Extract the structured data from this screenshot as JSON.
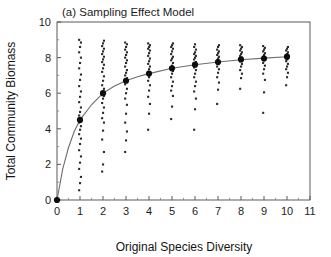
{
  "figure": {
    "panel_label": "(a)",
    "title": "Sampling Effect Model",
    "title_full": "(a)  Sampling Effect Model",
    "background_color": "#ffffff",
    "axis_color": "#5a5a5a",
    "point_color": "#2b2b2b",
    "curve_color": "#6e6e6e"
  },
  "chart_data": {
    "type": "scatter",
    "title": "(a)  Sampling Effect Model",
    "xlabel": "Original Species Diversity",
    "ylabel": "Total Community Biomass",
    "xlim": [
      0,
      11
    ],
    "ylim": [
      0,
      10
    ],
    "xticks": [
      0,
      1,
      2,
      3,
      4,
      5,
      6,
      7,
      8,
      9,
      10,
      11
    ],
    "yticks": [
      0,
      2,
      4,
      6,
      8,
      10
    ],
    "xtick_labels": [
      "0",
      "1",
      "2",
      "3",
      "4",
      "5",
      "6",
      "7",
      "8",
      "9",
      "10",
      "11"
    ],
    "ytick_labels": [
      "0",
      "2",
      "4",
      "6",
      "8",
      "10"
    ],
    "x_minor_tick_interval": 1,
    "y_minor_tick_interval": 1,
    "grid": false,
    "legend": false,
    "legend_position": "none",
    "series": [
      {
        "name": "Mean total community biomass",
        "marker": "filled-circle",
        "x": [
          0,
          1,
          2,
          3,
          4,
          5,
          6,
          7,
          8,
          9,
          10
        ],
        "values": [
          0.0,
          4.5,
          6.0,
          6.7,
          7.1,
          7.4,
          7.6,
          7.75,
          7.9,
          7.95,
          8.05
        ]
      },
      {
        "name": "Fitted saturating curve",
        "marker": "line",
        "x": [
          0,
          0.25,
          0.5,
          0.75,
          1,
          1.5,
          2,
          2.5,
          3,
          3.5,
          4,
          5,
          6,
          7,
          8,
          9,
          10
        ],
        "values": [
          0.0,
          1.75,
          2.95,
          3.85,
          4.5,
          5.35,
          6.0,
          6.4,
          6.7,
          6.92,
          7.1,
          7.4,
          7.6,
          7.75,
          7.88,
          7.97,
          8.05
        ]
      }
    ],
    "scatter_columns": [
      {
        "x": 0,
        "values": [
          0.0
        ]
      },
      {
        "x": 1,
        "values": [
          0.55,
          0.95,
          1.3,
          1.75,
          2.1,
          2.45,
          2.8,
          3.15,
          3.45,
          3.7,
          3.95,
          4.15,
          4.35,
          4.5,
          4.6,
          4.75,
          4.95,
          5.2,
          5.5,
          5.8,
          6.1,
          6.4,
          6.75,
          7.05,
          7.4,
          7.7,
          8.0,
          8.3,
          8.6,
          8.85,
          9.0
        ]
      },
      {
        "x": 2,
        "values": [
          1.6,
          2.0,
          2.7,
          3.4,
          3.9,
          4.35,
          4.6,
          4.9,
          5.2,
          5.45,
          5.7,
          5.85,
          6.0,
          6.1,
          6.25,
          6.45,
          6.7,
          6.95,
          7.2,
          7.4,
          7.6,
          7.75,
          7.9,
          8.05,
          8.2,
          8.35,
          8.5,
          8.65,
          8.8,
          8.95
        ]
      },
      {
        "x": 3,
        "values": [
          2.7,
          3.35,
          3.85,
          4.35,
          4.85,
          5.35,
          5.7,
          6.0,
          6.25,
          6.5,
          6.7,
          6.85,
          7.0,
          7.15,
          7.3,
          7.5,
          7.7,
          7.85,
          8.0,
          8.15,
          8.3,
          8.45,
          8.6,
          8.75,
          8.85
        ]
      },
      {
        "x": 4,
        "values": [
          3.95,
          4.85,
          5.4,
          5.8,
          6.15,
          6.45,
          6.7,
          6.9,
          7.05,
          7.2,
          7.35,
          7.5,
          7.65,
          7.8,
          7.95,
          8.1,
          8.25,
          8.4,
          8.5,
          8.6,
          8.7,
          8.8
        ]
      },
      {
        "x": 5,
        "values": [
          4.55,
          5.25,
          5.85,
          6.15,
          6.4,
          6.65,
          6.9,
          7.1,
          7.25,
          7.4,
          7.55,
          7.7,
          7.85,
          7.95,
          8.05,
          8.2,
          8.35,
          8.5,
          8.6,
          8.7,
          8.8
        ]
      },
      {
        "x": 6,
        "values": [
          3.95,
          5.1,
          5.7,
          6.1,
          6.4,
          6.65,
          6.9,
          7.1,
          7.3,
          7.45,
          7.6,
          7.75,
          7.9,
          8.0,
          8.1,
          8.2,
          8.3,
          8.45,
          8.6,
          8.75
        ]
      },
      {
        "x": 7,
        "values": [
          5.4,
          6.2,
          6.6,
          6.9,
          7.15,
          7.35,
          7.5,
          7.65,
          7.75,
          7.85,
          7.95,
          8.05,
          8.15,
          8.25,
          8.35,
          8.45,
          8.6,
          8.7
        ]
      },
      {
        "x": 8,
        "values": [
          6.25,
          6.85,
          7.1,
          7.3,
          7.5,
          7.65,
          7.8,
          7.9,
          8.0,
          8.1,
          8.2,
          8.3,
          8.4,
          8.5,
          8.6,
          8.7
        ]
      },
      {
        "x": 9,
        "values": [
          4.9,
          6.05,
          6.75,
          7.1,
          7.35,
          7.55,
          7.7,
          7.85,
          7.95,
          8.05,
          8.15,
          8.25,
          8.35,
          8.45,
          8.55,
          8.65
        ]
      },
      {
        "x": 10,
        "values": [
          6.45,
          6.9,
          7.15,
          7.35,
          7.5,
          7.65,
          7.8,
          7.9,
          8.0,
          8.1,
          8.2,
          8.3,
          8.4,
          8.5,
          8.6
        ]
      }
    ]
  }
}
